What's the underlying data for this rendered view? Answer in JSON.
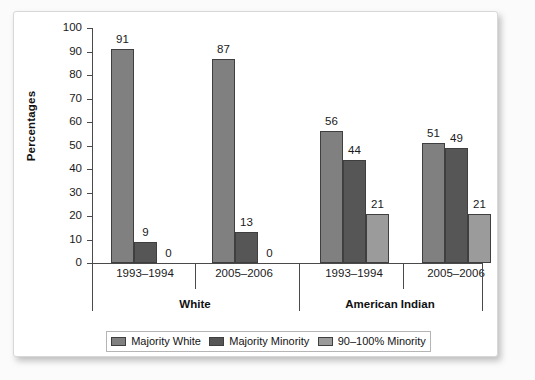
{
  "chart_data": {
    "type": "bar",
    "title": "",
    "xlabel": "",
    "ylabel": "Percentages",
    "ylim": [
      0,
      100
    ],
    "ytick_step": 10,
    "yticks": [
      100,
      90,
      80,
      70,
      60,
      50,
      40,
      30,
      20,
      10,
      0
    ],
    "grid": false,
    "legend_position": "bottom",
    "categories": [
      "1993–1994",
      "2005–2006",
      "1993–1994",
      "2005–2006"
    ],
    "group_labels": [
      "White",
      "American Indian"
    ],
    "series": [
      {
        "name": "Majority White",
        "color": "#808080",
        "values": [
          91,
          87,
          56,
          51
        ]
      },
      {
        "name": "Majority Minority",
        "color": "#565656",
        "values": [
          9,
          13,
          44,
          49
        ]
      },
      {
        "name": "90–100% Minority",
        "color": "#9b9b9b",
        "values": [
          0,
          0,
          21,
          21
        ]
      }
    ],
    "groups": [
      {
        "group": "White",
        "period": "1993–1994",
        "bars": [
          {
            "series": "Majority White",
            "value": 91,
            "label": "91"
          },
          {
            "series": "Majority Minority",
            "value": 9,
            "label": "9"
          },
          {
            "series": "90–100% Minority",
            "value": 0,
            "label": "0"
          }
        ]
      },
      {
        "group": "White",
        "period": "2005–2006",
        "bars": [
          {
            "series": "Majority White",
            "value": 87,
            "label": "87"
          },
          {
            "series": "Majority Minority",
            "value": 13,
            "label": "13"
          },
          {
            "series": "90–100% Minority",
            "value": 0,
            "label": "0"
          }
        ]
      },
      {
        "group": "American Indian",
        "period": "1993–1994",
        "bars": [
          {
            "series": "Majority White",
            "value": 56,
            "label": "56"
          },
          {
            "series": "Majority Minority",
            "value": 44,
            "label": "44"
          },
          {
            "series": "90–100% Minority",
            "value": 21,
            "label": "21"
          }
        ]
      },
      {
        "group": "American Indian",
        "period": "2005–2006",
        "bars": [
          {
            "series": "Majority White",
            "value": 51,
            "label": "51"
          },
          {
            "series": "Majority Minority",
            "value": 49,
            "label": "49"
          },
          {
            "series": "90–100% Minority",
            "value": 21,
            "label": "21"
          }
        ]
      }
    ]
  },
  "axis": {
    "y_title": "Percentages",
    "y_ticks": [
      "100",
      "90",
      "80",
      "70",
      "60",
      "50",
      "40",
      "30",
      "20",
      "10",
      "0"
    ],
    "year_labels": [
      "1993–1994",
      "2005–2006",
      "1993–1994",
      "2005–2006"
    ],
    "group_labels": [
      "White",
      "American Indian"
    ]
  },
  "legend": {
    "items": [
      {
        "label": "Majority White",
        "color": "#808080"
      },
      {
        "label": "Majority Minority",
        "color": "#565656"
      },
      {
        "label": "90–100% Minority",
        "color": "#9b9b9b"
      }
    ]
  },
  "colors": {
    "series_majority_white": "#808080",
    "series_majority_minority": "#565656",
    "series_90_100_minority": "#9b9b9b",
    "axis": "#4a4a4a",
    "card_background": "#ffffff"
  }
}
